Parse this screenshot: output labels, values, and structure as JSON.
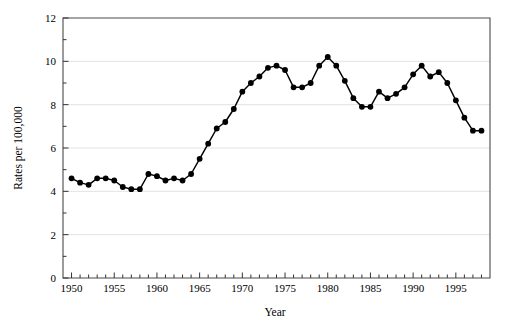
{
  "chart_data": {
    "type": "line",
    "title": "",
    "subtitle": "",
    "xlabel": "Year",
    "ylabel": "Rates per 100,000",
    "xlim": [
      1949,
      1999
    ],
    "ylim": [
      0,
      12
    ],
    "grid": true,
    "legend": null,
    "x_major_ticks": [
      1950,
      1955,
      1960,
      1965,
      1970,
      1975,
      1980,
      1985,
      1990,
      1995
    ],
    "x_major_tick_labels": [
      "1950",
      "1955",
      "1960",
      "1965",
      "1970",
      "1975",
      "1980",
      "1985",
      "1990",
      "1995"
    ],
    "x_minor_tick_interval": 1,
    "y_major_ticks": [
      0,
      2,
      4,
      6,
      8,
      10,
      12
    ],
    "y_major_tick_labels": [
      "0",
      "2",
      "4",
      "6",
      "8",
      "10",
      "12"
    ],
    "y_minor_tick_interval": 1,
    "marker": "filled-circle",
    "marker_color": "#000000",
    "line_color": "#000000",
    "x": [
      1950,
      1951,
      1952,
      1953,
      1954,
      1955,
      1956,
      1957,
      1958,
      1959,
      1960,
      1961,
      1962,
      1963,
      1964,
      1965,
      1966,
      1967,
      1968,
      1969,
      1970,
      1971,
      1972,
      1973,
      1974,
      1975,
      1976,
      1977,
      1978,
      1979,
      1980,
      1981,
      1982,
      1983,
      1984,
      1985,
      1986,
      1987,
      1988,
      1989,
      1990,
      1991,
      1992,
      1993,
      1994,
      1995,
      1996,
      1997,
      1998
    ],
    "values": [
      4.6,
      4.4,
      4.3,
      4.6,
      4.6,
      4.5,
      4.2,
      4.1,
      4.1,
      4.8,
      4.7,
      4.5,
      4.6,
      4.5,
      4.8,
      5.5,
      6.2,
      6.9,
      7.2,
      7.8,
      8.6,
      9.0,
      9.3,
      9.7,
      9.8,
      9.6,
      8.8,
      8.8,
      9.0,
      9.8,
      10.2,
      9.8,
      9.1,
      8.3,
      7.9,
      7.9,
      8.6,
      8.3,
      8.5,
      8.8,
      9.4,
      9.8,
      9.3,
      9.5,
      9.0,
      8.2,
      7.4,
      6.8,
      6.8
    ]
  },
  "axes": {
    "x_axis_title": "Year",
    "y_axis_title": "Rates per 100,000"
  },
  "colors": {
    "series": "#000000",
    "grid": "#e3e3e3",
    "frame": "#4a4a4a",
    "background": "#ffffff"
  }
}
